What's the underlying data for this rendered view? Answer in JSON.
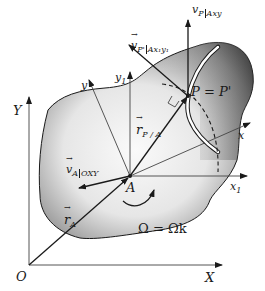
{
  "figure": {
    "type": "rigid body kinematics diagram",
    "colors": {
      "body_dark": "#3a3a3a",
      "body_light": "#f2f2f2",
      "line": "#1a1a1a",
      "background": "#ffffff"
    }
  },
  "labels": {
    "origin": "O",
    "X_axis": "X",
    "Y_axis": "Y",
    "point_A": "A",
    "point_P": "P = P'",
    "x_axis": "x",
    "y_axis": "y",
    "x1_axis": "x",
    "x1_sub": "1",
    "y1_axis": "y",
    "y1_sub": "1",
    "r_A": "r",
    "r_A_sub": "A",
    "r_PA": "r",
    "r_PA_sub": "P / A",
    "v_A": "v",
    "v_A_sub": "A",
    "v_A_frame": "OXY",
    "v_P": "v",
    "v_P_sub": "P",
    "v_P_frame": "Axy",
    "v_Pp": "v",
    "v_Pp_sub": "P'",
    "v_Pp_frame": "Ax₁y₁",
    "omega": "Ω = Ωk"
  }
}
